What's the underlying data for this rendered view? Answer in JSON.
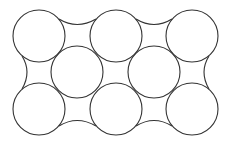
{
  "diagram": {
    "stroke_color": "#333333",
    "background": "#ffffff",
    "radius": 26,
    "circles": [
      {
        "id": "top-left",
        "cx": 39,
        "cy": 36
      },
      {
        "id": "top-middle",
        "cx": 116,
        "cy": 36
      },
      {
        "id": "top-right",
        "cx": 192,
        "cy": 36
      },
      {
        "id": "middle-left",
        "cx": 77,
        "cy": 72
      },
      {
        "id": "middle-right",
        "cx": 154,
        "cy": 72
      },
      {
        "id": "bottom-left",
        "cx": 39,
        "cy": 109
      },
      {
        "id": "bottom-middle",
        "cx": 116,
        "cy": 109
      },
      {
        "id": "bottom-right",
        "cx": 192,
        "cy": 109
      }
    ]
  }
}
